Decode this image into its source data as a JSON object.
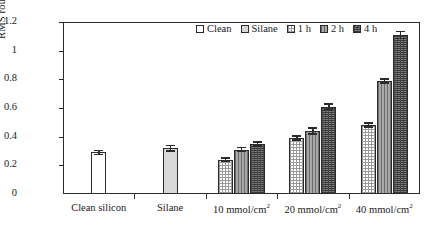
{
  "chart_data": {
    "type": "bar",
    "title": "",
    "xlabel": "",
    "ylabel": "RMS roughness (nm)",
    "ylim": [
      0,
      1.2
    ],
    "ytick_labels": [
      "0",
      "0.2",
      "0.4",
      "0.6",
      "0.8",
      "1",
      "1.2"
    ],
    "ytick_values": [
      0,
      0.2,
      0.4,
      0.6,
      0.8,
      1.0,
      1.2
    ],
    "grid": false,
    "legend_position": "top-center",
    "categories": [
      "Clean silicon",
      "Silane",
      "10 mmol/cm2",
      "20 mmol/cm2",
      "40 mmol/cm2"
    ],
    "category_labels": [
      {
        "text": "Clean silicon",
        "sup": ""
      },
      {
        "text": "Silane",
        "sup": ""
      },
      {
        "text": "10 mmol/cm",
        "sup": "2"
      },
      {
        "text": "20 mmol/cm",
        "sup": "2"
      },
      {
        "text": "40 mmol/cm",
        "sup": "2"
      }
    ],
    "series": [
      {
        "name": "Clean",
        "fill": "f-clean",
        "values": [
          0.29,
          null,
          null,
          null,
          null
        ],
        "errors": [
          0.02,
          null,
          null,
          null,
          null
        ]
      },
      {
        "name": "Silane",
        "fill": "f-silane",
        "values": [
          null,
          0.32,
          null,
          null,
          null
        ],
        "errors": [
          null,
          0.025,
          null,
          null,
          null
        ]
      },
      {
        "name": "1 h",
        "fill": "f-1h",
        "values": [
          null,
          null,
          0.24,
          0.39,
          0.48
        ],
        "errors": [
          null,
          null,
          0.015,
          0.02,
          0.02
        ]
      },
      {
        "name": "2 h",
        "fill": "f-2h",
        "values": [
          null,
          null,
          0.31,
          0.44,
          0.79
        ],
        "errors": [
          null,
          null,
          0.02,
          0.025,
          0.02
        ]
      },
      {
        "name": "4 h",
        "fill": "f-4h",
        "values": [
          null,
          null,
          0.35,
          0.61,
          1.11
        ],
        "errors": [
          null,
          null,
          0.02,
          0.025,
          0.03
        ]
      }
    ],
    "legend": [
      {
        "label": "Clean",
        "fill": "f-clean"
      },
      {
        "label": "Silane",
        "fill": "f-silane"
      },
      {
        "label": "1 h",
        "fill": "f-1h"
      },
      {
        "label": "2 h",
        "fill": "f-2h"
      },
      {
        "label": "4 h",
        "fill": "f-4h"
      }
    ],
    "colors": {
      "axis": "#2b2b2b",
      "clean": "#ffffff",
      "silane": "#d8d8d8",
      "h1": "#f2f2f2",
      "h2": "#a8a8a8",
      "h4": "#7d7d7d"
    }
  }
}
